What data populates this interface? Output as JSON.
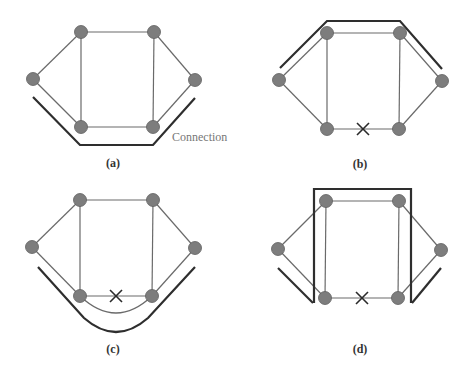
{
  "figure": {
    "panels": [
      {
        "id": "a",
        "caption": "(a)",
        "annotation": "Connection",
        "failed_link": false
      },
      {
        "id": "b",
        "caption": "(b)",
        "failed_link": true
      },
      {
        "id": "c",
        "caption": "(c)",
        "failed_link": true
      },
      {
        "id": "d",
        "caption": "(d)",
        "failed_link": true
      }
    ],
    "colors": {
      "node_fill": "#7d7d7d",
      "edge": "#6a6a6a",
      "connection_path": "#2e2e2e",
      "annotation_text": "#777777"
    }
  }
}
